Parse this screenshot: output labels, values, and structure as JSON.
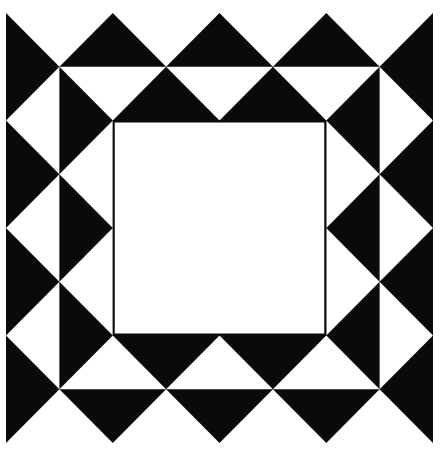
{
  "figure": {
    "name": "quilt-block-pattern",
    "canvas": {
      "width": 443,
      "height": 456
    },
    "colors": {
      "background": "#ffffff",
      "ink": "#0a0a0a",
      "paper": "#ffffff"
    },
    "outer_square": {
      "x0": 6,
      "y0": 13,
      "x1": 433,
      "y1": 443
    },
    "grid_divisions": 8,
    "inner_square": {
      "from_index": 2,
      "to_index": 6,
      "stroke_width": 2
    },
    "white_triangles": [
      {
        "group": "outer-top",
        "points": [
          [
            0,
            0
          ],
          [
            2,
            0
          ],
          [
            1,
            1
          ]
        ]
      },
      {
        "group": "outer-top",
        "points": [
          [
            2,
            0
          ],
          [
            4,
            0
          ],
          [
            3,
            1
          ]
        ]
      },
      {
        "group": "outer-top",
        "points": [
          [
            4,
            0
          ],
          [
            6,
            0
          ],
          [
            5,
            1
          ]
        ]
      },
      {
        "group": "outer-top",
        "points": [
          [
            6,
            0
          ],
          [
            8,
            0
          ],
          [
            7,
            1
          ]
        ]
      },
      {
        "group": "outer-bottom",
        "points": [
          [
            0,
            8
          ],
          [
            2,
            8
          ],
          [
            1,
            7
          ]
        ]
      },
      {
        "group": "outer-bottom",
        "points": [
          [
            2,
            8
          ],
          [
            4,
            8
          ],
          [
            3,
            7
          ]
        ]
      },
      {
        "group": "outer-bottom",
        "points": [
          [
            4,
            8
          ],
          [
            6,
            8
          ],
          [
            5,
            7
          ]
        ]
      },
      {
        "group": "outer-bottom",
        "points": [
          [
            6,
            8
          ],
          [
            8,
            8
          ],
          [
            7,
            7
          ]
        ]
      },
      {
        "group": "outer-left",
        "points": [
          [
            0,
            2
          ],
          [
            1,
            1
          ],
          [
            1,
            3
          ]
        ]
      },
      {
        "group": "outer-left",
        "points": [
          [
            0,
            4
          ],
          [
            1,
            3
          ],
          [
            1,
            5
          ]
        ]
      },
      {
        "group": "outer-left",
        "points": [
          [
            0,
            6
          ],
          [
            1,
            5
          ],
          [
            1,
            7
          ]
        ]
      },
      {
        "group": "outer-right",
        "points": [
          [
            8,
            2
          ],
          [
            7,
            1
          ],
          [
            7,
            3
          ]
        ]
      },
      {
        "group": "outer-right",
        "points": [
          [
            8,
            4
          ],
          [
            7,
            3
          ],
          [
            7,
            5
          ]
        ]
      },
      {
        "group": "outer-right",
        "points": [
          [
            8,
            6
          ],
          [
            7,
            5
          ],
          [
            7,
            7
          ]
        ]
      },
      {
        "group": "inner-top",
        "points": [
          [
            1,
            1
          ],
          [
            3,
            1
          ],
          [
            2,
            2
          ]
        ]
      },
      {
        "group": "inner-top",
        "points": [
          [
            3,
            1
          ],
          [
            5,
            1
          ],
          [
            4,
            2
          ]
        ]
      },
      {
        "group": "inner-top",
        "points": [
          [
            5,
            1
          ],
          [
            7,
            1
          ],
          [
            6,
            2
          ]
        ]
      },
      {
        "group": "inner-bottom",
        "points": [
          [
            1,
            7
          ],
          [
            3,
            7
          ],
          [
            2,
            6
          ]
        ]
      },
      {
        "group": "inner-bottom",
        "points": [
          [
            3,
            7
          ],
          [
            5,
            7
          ],
          [
            4,
            6
          ]
        ]
      },
      {
        "group": "inner-bottom",
        "points": [
          [
            5,
            7
          ],
          [
            7,
            7
          ],
          [
            6,
            6
          ]
        ]
      },
      {
        "group": "inner-left",
        "points": [
          [
            1,
            3
          ],
          [
            2,
            2
          ],
          [
            2,
            4
          ]
        ]
      },
      {
        "group": "inner-left",
        "points": [
          [
            1,
            5
          ],
          [
            2,
            4
          ],
          [
            2,
            6
          ]
        ]
      },
      {
        "group": "inner-right",
        "points": [
          [
            7,
            3
          ],
          [
            6,
            2
          ],
          [
            6,
            4
          ]
        ]
      },
      {
        "group": "inner-right",
        "points": [
          [
            7,
            5
          ],
          [
            6,
            4
          ],
          [
            6,
            6
          ]
        ]
      }
    ]
  }
}
